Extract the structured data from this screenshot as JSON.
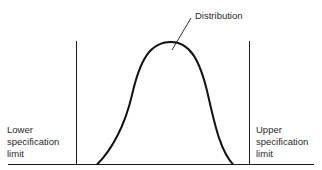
{
  "diagram": {
    "labels": {
      "distribution": "Distribution",
      "lower_limit": [
        "Lower",
        "specification",
        "limit"
      ],
      "upper_limit": [
        "Upper",
        "specification",
        "limit"
      ]
    },
    "colors": {
      "line": "#1a1a1a",
      "text": "#2a2a2a",
      "background": "#ffffff"
    }
  }
}
